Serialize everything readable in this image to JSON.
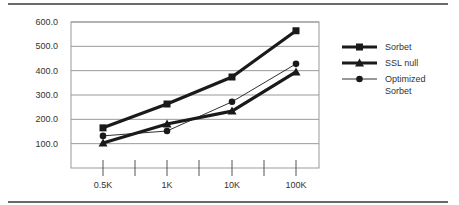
{
  "chart_data": {
    "type": "line",
    "title": "",
    "xlabel": "",
    "ylabel": "",
    "categories": [
      "0.5K",
      "1K",
      "10K",
      "100K"
    ],
    "ylim": [
      0,
      600
    ],
    "yticks": [
      "100.0",
      "200.0",
      "300.0",
      "400.0",
      "500.0",
      "600.0"
    ],
    "grid": true,
    "legend_position": "right",
    "series": [
      {
        "name": "Sorbet",
        "marker": "square",
        "line": "thick",
        "values": [
          165,
          263,
          374,
          564
        ]
      },
      {
        "name": "SSL null",
        "marker": "triangle",
        "line": "thick",
        "values": [
          103,
          181,
          234,
          395
        ]
      },
      {
        "name": "Optimized Sorbet",
        "marker": "circle",
        "line": "thin",
        "values": [
          132,
          152,
          272,
          428
        ]
      }
    ]
  },
  "legend": {
    "items": [
      {
        "label_lines": [
          "Sorbet"
        ]
      },
      {
        "label_lines": [
          "SSL null"
        ]
      },
      {
        "label_lines": [
          "Optimized",
          "Sorbet"
        ]
      }
    ]
  }
}
